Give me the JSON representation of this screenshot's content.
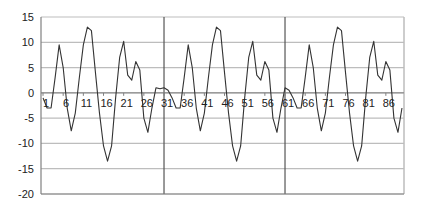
{
  "chart_data": {
    "type": "line",
    "title": "",
    "xlabel": "",
    "ylabel": "",
    "ylim": [
      -20,
      15
    ],
    "yticks": [
      15,
      10,
      5,
      0,
      -5,
      -10,
      -15,
      -20
    ],
    "xtick_labels": [
      "1",
      "6",
      "11",
      "16",
      "21",
      "26",
      "31",
      "36",
      "41",
      "46",
      "51",
      "56",
      "61",
      "66",
      "71",
      "76",
      "81",
      "86"
    ],
    "x_count": 90,
    "grid": {
      "horizontal": true,
      "vertical": false
    },
    "vertical_dividers_at_x": [
      30.5,
      60.5
    ],
    "legend": null,
    "series": [
      {
        "name": "Series 1",
        "color": "#333333",
        "values": [
          -1,
          -3,
          -3,
          3,
          9.5,
          5,
          -3,
          -7.5,
          -4,
          3,
          9.5,
          13,
          12.3,
          4,
          -4,
          -10.5,
          -13.5,
          -10.5,
          -1,
          7,
          10.2,
          3.5,
          2.5,
          6.2,
          4.5,
          -5,
          -7.8,
          -3,
          1,
          0.8,
          1,
          0.5,
          -1,
          -3,
          -3,
          3,
          9.5,
          5,
          -3,
          -7.5,
          -4,
          3,
          9.5,
          13,
          12.3,
          4,
          -4,
          -10.5,
          -13.5,
          -10.5,
          -1,
          7,
          10.2,
          3.5,
          2.5,
          6.2,
          4.5,
          -5,
          -7.8,
          -3,
          1,
          0.5,
          -1,
          -3,
          -3,
          3,
          9.5,
          5,
          -3,
          -7.5,
          -4,
          3,
          9.5,
          13,
          12.3,
          4,
          -4,
          -10.5,
          -13.5,
          -10.5,
          -1,
          7,
          10.2,
          3.5,
          2.5,
          6.2,
          4.5,
          -5,
          -7.8,
          -3
        ]
      }
    ]
  },
  "colors": {
    "line": "#333333",
    "grid": "#bdbdbd",
    "axis": "#808080",
    "divider": "#555555",
    "border": "#bdbdbd"
  }
}
